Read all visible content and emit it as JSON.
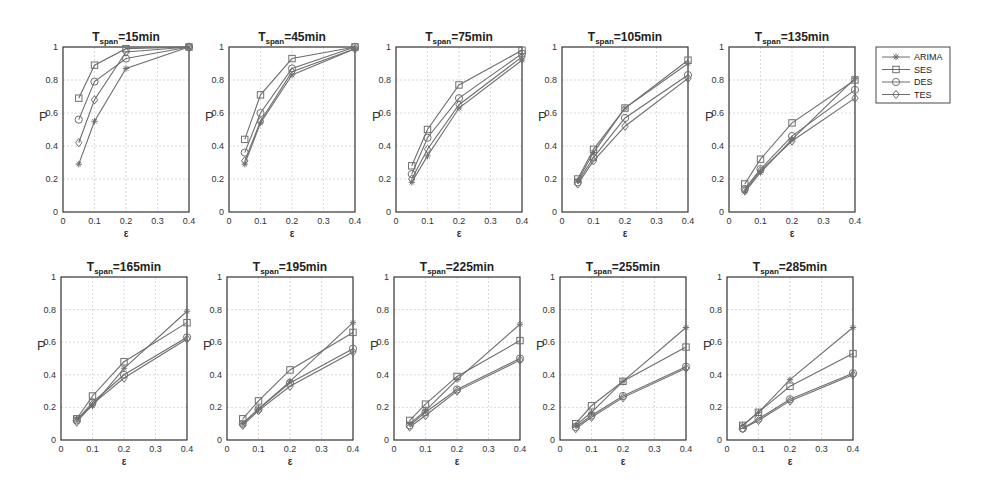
{
  "figure": {
    "legend": [
      "ARIMA",
      "SES",
      "DES",
      "TES"
    ],
    "legend_markers": [
      "star",
      "square",
      "circle",
      "diamond"
    ],
    "colors": {
      "line": "#6e6e6e",
      "axis": "#333333",
      "grid": "#cfcfcf",
      "background": "#ffffff"
    }
  },
  "chart_data": [
    {
      "type": "line",
      "title": "T_span=15min",
      "title_main": "T",
      "title_sub": "span",
      "title_rest": "=15min",
      "xlabel": "ε",
      "ylabel": "P",
      "xlim": [
        0,
        0.4
      ],
      "ylim": [
        0,
        1
      ],
      "x": [
        0.05,
        0.1,
        0.2,
        0.4
      ],
      "xticks": [
        0,
        0.1,
        0.2,
        0.3,
        0.4
      ],
      "yticks": [
        0,
        0.2,
        0.4,
        0.6,
        0.8,
        1
      ],
      "grid": true,
      "series": [
        {
          "name": "ARIMA",
          "values": [
            0.29,
            0.55,
            0.87,
            1.0
          ]
        },
        {
          "name": "SES",
          "values": [
            0.69,
            0.89,
            0.99,
            1.0
          ]
        },
        {
          "name": "DES",
          "values": [
            0.56,
            0.79,
            0.93,
            1.0
          ]
        },
        {
          "name": "TES",
          "values": [
            0.42,
            0.68,
            0.97,
            1.0
          ]
        }
      ]
    },
    {
      "type": "line",
      "title": "T_span=45min",
      "title_main": "T",
      "title_sub": "span",
      "title_rest": "=45min",
      "xlabel": "ε",
      "ylabel": "P",
      "xlim": [
        0,
        0.4
      ],
      "ylim": [
        0,
        1
      ],
      "x": [
        0.05,
        0.1,
        0.2,
        0.4
      ],
      "xticks": [
        0,
        0.1,
        0.2,
        0.3,
        0.4
      ],
      "yticks": [
        0,
        0.2,
        0.4,
        0.6,
        0.8,
        1
      ],
      "grid": true,
      "series": [
        {
          "name": "ARIMA",
          "values": [
            0.29,
            0.54,
            0.83,
            0.99
          ]
        },
        {
          "name": "SES",
          "values": [
            0.44,
            0.71,
            0.93,
            1.0
          ]
        },
        {
          "name": "DES",
          "values": [
            0.36,
            0.6,
            0.87,
            1.0
          ]
        },
        {
          "name": "TES",
          "values": [
            0.31,
            0.55,
            0.85,
            0.99
          ]
        }
      ]
    },
    {
      "type": "line",
      "title": "T_span=75min",
      "title_main": "T",
      "title_sub": "span",
      "title_rest": "=75min",
      "xlabel": "ε",
      "ylabel": "P",
      "xlim": [
        0,
        0.4
      ],
      "ylim": [
        0,
        1
      ],
      "x": [
        0.05,
        0.1,
        0.2,
        0.4
      ],
      "xticks": [
        0,
        0.1,
        0.2,
        0.3,
        0.4
      ],
      "yticks": [
        0,
        0.2,
        0.4,
        0.6,
        0.8,
        1
      ],
      "grid": true,
      "series": [
        {
          "name": "ARIMA",
          "values": [
            0.18,
            0.34,
            0.63,
            0.92
          ]
        },
        {
          "name": "SES",
          "values": [
            0.28,
            0.5,
            0.77,
            0.98
          ]
        },
        {
          "name": "DES",
          "values": [
            0.23,
            0.45,
            0.69,
            0.96
          ]
        },
        {
          "name": "TES",
          "values": [
            0.2,
            0.38,
            0.65,
            0.94
          ]
        }
      ]
    },
    {
      "type": "line",
      "title": "T_span=105min",
      "title_main": "T",
      "title_sub": "span",
      "title_rest": "=105min",
      "xlabel": "ε",
      "ylabel": "P",
      "xlim": [
        0,
        0.4
      ],
      "ylim": [
        0,
        1
      ],
      "x": [
        0.05,
        0.1,
        0.2,
        0.4
      ],
      "xticks": [
        0,
        0.1,
        0.2,
        0.3,
        0.4
      ],
      "yticks": [
        0,
        0.2,
        0.4,
        0.6,
        0.8,
        1
      ],
      "grid": true,
      "series": [
        {
          "name": "ARIMA",
          "values": [
            0.19,
            0.36,
            0.63,
            0.9
          ]
        },
        {
          "name": "SES",
          "values": [
            0.2,
            0.38,
            0.63,
            0.92
          ]
        },
        {
          "name": "DES",
          "values": [
            0.18,
            0.33,
            0.57,
            0.83
          ]
        },
        {
          "name": "TES",
          "values": [
            0.17,
            0.31,
            0.52,
            0.81
          ]
        }
      ]
    },
    {
      "type": "line",
      "title": "T_span=135min",
      "title_main": "T",
      "title_sub": "span",
      "title_rest": "=135min",
      "xlabel": "ε",
      "ylabel": "P",
      "xlim": [
        0,
        0.4
      ],
      "ylim": [
        0,
        1
      ],
      "x": [
        0.05,
        0.1,
        0.2,
        0.4
      ],
      "xticks": [
        0,
        0.1,
        0.2,
        0.3,
        0.4
      ],
      "yticks": [
        0,
        0.2,
        0.4,
        0.6,
        0.8,
        1
      ],
      "grid": true,
      "series": [
        {
          "name": "ARIMA",
          "values": [
            0.12,
            0.24,
            0.44,
            0.81
          ]
        },
        {
          "name": "SES",
          "values": [
            0.17,
            0.32,
            0.54,
            0.8
          ]
        },
        {
          "name": "DES",
          "values": [
            0.14,
            0.26,
            0.46,
            0.74
          ]
        },
        {
          "name": "TES",
          "values": [
            0.13,
            0.25,
            0.43,
            0.69
          ]
        }
      ]
    },
    {
      "type": "line",
      "title": "T_span=165min",
      "title_main": "T",
      "title_sub": "span",
      "title_rest": "=165min",
      "xlabel": "ε",
      "ylabel": "P",
      "xlim": [
        0,
        0.4
      ],
      "ylim": [
        0,
        1
      ],
      "x": [
        0.05,
        0.1,
        0.2,
        0.4
      ],
      "xticks": [
        0,
        0.1,
        0.2,
        0.3,
        0.4
      ],
      "yticks": [
        0,
        0.2,
        0.4,
        0.6,
        0.8,
        1
      ],
      "grid": true,
      "series": [
        {
          "name": "ARIMA",
          "values": [
            0.13,
            0.21,
            0.44,
            0.79
          ]
        },
        {
          "name": "SES",
          "values": [
            0.13,
            0.27,
            0.48,
            0.72
          ]
        },
        {
          "name": "DES",
          "values": [
            0.12,
            0.23,
            0.4,
            0.63
          ]
        },
        {
          "name": "TES",
          "values": [
            0.11,
            0.22,
            0.38,
            0.62
          ]
        }
      ]
    },
    {
      "type": "line",
      "title": "T_span=195min",
      "title_main": "T",
      "title_sub": "span",
      "title_rest": "=195min",
      "xlabel": "ε",
      "ylabel": "P",
      "xlim": [
        0,
        0.4
      ],
      "ylim": [
        0,
        1
      ],
      "x": [
        0.05,
        0.1,
        0.2,
        0.4
      ],
      "xticks": [
        0,
        0.1,
        0.2,
        0.3,
        0.4
      ],
      "yticks": [
        0,
        0.2,
        0.4,
        0.6,
        0.8,
        1
      ],
      "grid": true,
      "series": [
        {
          "name": "ARIMA",
          "values": [
            0.1,
            0.19,
            0.36,
            0.72
          ]
        },
        {
          "name": "SES",
          "values": [
            0.13,
            0.24,
            0.43,
            0.66
          ]
        },
        {
          "name": "DES",
          "values": [
            0.1,
            0.19,
            0.35,
            0.56
          ]
        },
        {
          "name": "TES",
          "values": [
            0.09,
            0.18,
            0.33,
            0.54
          ]
        }
      ]
    },
    {
      "type": "line",
      "title": "T_span=225min",
      "title_main": "T",
      "title_sub": "span",
      "title_rest": "=225min",
      "xlabel": "ε",
      "ylabel": "P",
      "xlim": [
        0,
        0.4
      ],
      "ylim": [
        0,
        1
      ],
      "x": [
        0.05,
        0.1,
        0.2,
        0.4
      ],
      "xticks": [
        0,
        0.1,
        0.2,
        0.3,
        0.4
      ],
      "yticks": [
        0,
        0.2,
        0.4,
        0.6,
        0.8,
        1
      ],
      "grid": true,
      "series": [
        {
          "name": "ARIMA",
          "values": [
            0.1,
            0.18,
            0.37,
            0.71
          ]
        },
        {
          "name": "SES",
          "values": [
            0.12,
            0.22,
            0.39,
            0.61
          ]
        },
        {
          "name": "DES",
          "values": [
            0.09,
            0.17,
            0.31,
            0.5
          ]
        },
        {
          "name": "TES",
          "values": [
            0.08,
            0.15,
            0.3,
            0.49
          ]
        }
      ]
    },
    {
      "type": "line",
      "title": "T_span=255min",
      "title_main": "T",
      "title_sub": "span",
      "title_rest": "=255min",
      "xlabel": "ε",
      "ylabel": "P",
      "xlim": [
        0,
        0.4
      ],
      "ylim": [
        0,
        1
      ],
      "x": [
        0.05,
        0.1,
        0.2,
        0.4
      ],
      "xticks": [
        0,
        0.1,
        0.2,
        0.3,
        0.4
      ],
      "yticks": [
        0,
        0.2,
        0.4,
        0.6,
        0.8,
        1
      ],
      "grid": true,
      "series": [
        {
          "name": "ARIMA",
          "values": [
            0.09,
            0.17,
            0.36,
            0.69
          ]
        },
        {
          "name": "SES",
          "values": [
            0.1,
            0.21,
            0.36,
            0.57
          ]
        },
        {
          "name": "DES",
          "values": [
            0.08,
            0.15,
            0.27,
            0.45
          ]
        },
        {
          "name": "TES",
          "values": [
            0.07,
            0.14,
            0.26,
            0.44
          ]
        }
      ]
    },
    {
      "type": "line",
      "title": "T_span=285min",
      "title_main": "T",
      "title_sub": "span",
      "title_rest": "=285min",
      "xlabel": "ε",
      "ylabel": "P",
      "xlim": [
        0,
        0.4
      ],
      "ylim": [
        0,
        1
      ],
      "x": [
        0.05,
        0.1,
        0.2,
        0.4
      ],
      "xticks": [
        0,
        0.1,
        0.2,
        0.3,
        0.4
      ],
      "yticks": [
        0,
        0.2,
        0.4,
        0.6,
        0.8,
        1
      ],
      "grid": true,
      "series": [
        {
          "name": "ARIMA",
          "values": [
            0.09,
            0.17,
            0.37,
            0.69
          ]
        },
        {
          "name": "SES",
          "values": [
            0.09,
            0.17,
            0.33,
            0.53
          ]
        },
        {
          "name": "DES",
          "values": [
            0.07,
            0.13,
            0.25,
            0.41
          ]
        },
        {
          "name": "TES",
          "values": [
            0.07,
            0.12,
            0.24,
            0.4
          ]
        }
      ]
    }
  ]
}
